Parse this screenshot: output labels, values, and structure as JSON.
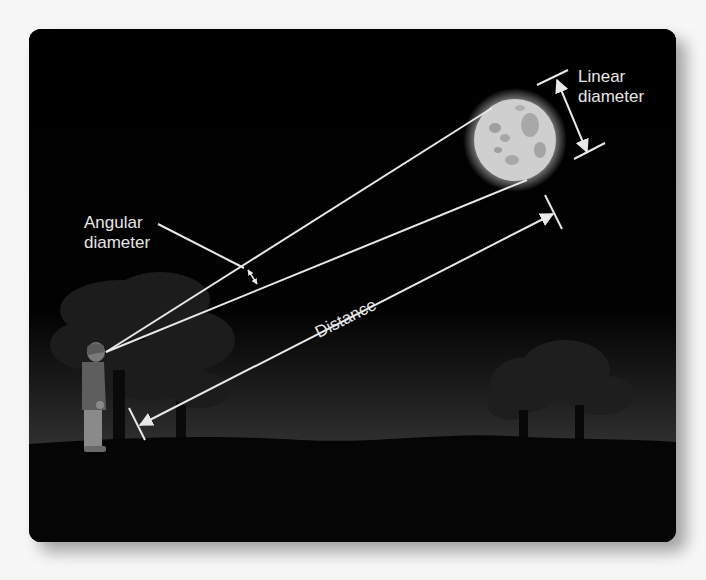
{
  "diagram": {
    "labels": {
      "angular_line1": "Angular",
      "angular_line2": "diameter",
      "linear_line1": "Linear",
      "linear_line2": "diameter",
      "distance": "Distance"
    },
    "icons": {
      "moon": "moon-icon",
      "observer": "person-icon",
      "trees": "tree-icon"
    },
    "colors": {
      "background": "#000000",
      "line": "#e8e8e8",
      "moon": "#cfcfcf",
      "text": "#e6e6e6",
      "page": "#f7f7f7"
    }
  }
}
